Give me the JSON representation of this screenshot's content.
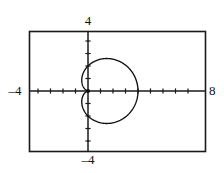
{
  "plot": {
    "frame": {
      "x_left": 29,
      "y_top": 31,
      "x_right": 206,
      "y_bottom": 152
    },
    "origin": {
      "x": 88,
      "y": 91
    },
    "pixels_per_unit": 12.5,
    "labels": {
      "x_min": "–4",
      "x_max": "8",
      "y_max": "4",
      "y_min": "–4"
    },
    "colors": {
      "background": "#ffffff",
      "frame": "#1a1a1a",
      "axis": "#1a1a1a",
      "curve": "#111111"
    }
  },
  "chart_data": {
    "type": "line",
    "title": "",
    "subtitle": "",
    "xlabel": "",
    "ylabel": "",
    "xlim": [
      -4,
      8
    ],
    "ylim": [
      -4,
      4
    ],
    "grid": false,
    "legend": null,
    "tick_labels": {
      "x": [
        "-4",
        "8"
      ],
      "y": [
        "-4",
        "4"
      ]
    },
    "x_tick_step": 1,
    "y_tick_step": 1,
    "annotations": [],
    "series": [
      {
        "name": "cardioid",
        "kind": "polar",
        "equation": "r = 2(1 + cos θ)",
        "closed": true,
        "theta_range_deg": [
          0,
          360
        ],
        "key_points": {
          "right_vertex": [
            4,
            0
          ],
          "top": [
            1,
            1.7
          ],
          "bottom": [
            1,
            -1.7
          ],
          "cusp": [
            0,
            0
          ]
        },
        "points": [
          [
            4.0,
            0.0
          ],
          [
            3.97,
            0.17
          ],
          [
            3.88,
            0.35
          ],
          [
            3.73,
            0.51
          ],
          [
            3.54,
            0.66
          ],
          [
            3.3,
            0.8
          ],
          [
            3.03,
            0.93
          ],
          [
            2.73,
            1.04
          ],
          [
            2.41,
            1.14
          ],
          [
            2.09,
            1.21
          ],
          [
            1.77,
            1.26
          ],
          [
            1.45,
            1.3
          ],
          [
            1.15,
            1.31
          ],
          [
            0.87,
            1.3
          ],
          [
            0.62,
            1.27
          ],
          [
            0.4,
            1.21
          ],
          [
            0.22,
            1.13
          ],
          [
            0.09,
            1.02
          ],
          [
            0.01,
            0.88
          ],
          [
            -0.02,
            0.72
          ],
          [
            0.0,
            0.55
          ],
          [
            0.07,
            0.38
          ],
          [
            0.18,
            0.22
          ],
          [
            0.32,
            0.08
          ],
          [
            0.0,
            0.0
          ],
          [
            0.32,
            -0.08
          ],
          [
            0.18,
            -0.22
          ],
          [
            0.07,
            -0.38
          ],
          [
            0.0,
            -0.55
          ],
          [
            -0.02,
            -0.72
          ],
          [
            0.01,
            -0.88
          ],
          [
            0.09,
            -1.02
          ],
          [
            0.22,
            -1.13
          ],
          [
            0.4,
            -1.21
          ],
          [
            0.62,
            -1.27
          ],
          [
            0.87,
            -1.3
          ],
          [
            1.15,
            -1.31
          ],
          [
            1.45,
            -1.3
          ],
          [
            1.77,
            -1.26
          ],
          [
            2.09,
            -1.21
          ],
          [
            2.41,
            -1.14
          ],
          [
            2.73,
            -1.04
          ],
          [
            3.03,
            -0.93
          ],
          [
            3.3,
            -0.8
          ],
          [
            3.54,
            -0.66
          ],
          [
            3.73,
            -0.51
          ],
          [
            3.88,
            -0.35
          ],
          [
            3.97,
            -0.17
          ],
          [
            4.0,
            0.0
          ]
        ]
      }
    ]
  }
}
